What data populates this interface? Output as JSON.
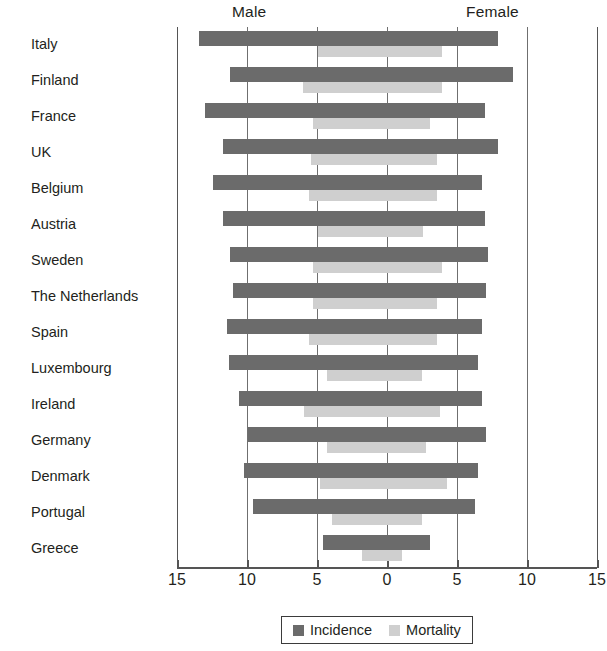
{
  "header": {
    "male_label": "Male",
    "female_label": "Female"
  },
  "legend": {
    "incidence_label": "Incidence",
    "mortality_label": "Mortality"
  },
  "colors": {
    "incidence": "#6b6b6b",
    "mortality": "#cfcfcf",
    "axis": "#555555",
    "grid": "#6f6f6f",
    "text": "#231f20"
  },
  "axis": {
    "tick_labels": [
      "15",
      "10",
      "5",
      "0",
      "5",
      "10",
      "15"
    ],
    "tick_values": [
      -15,
      -10,
      -5,
      0,
      5,
      10,
      15
    ],
    "min": -15,
    "max": 15
  },
  "chart_data": {
    "type": "bar",
    "title": "",
    "subtitle": "",
    "orientation": "horizontal",
    "style": "population-pyramid",
    "xlabel": "",
    "ylabel": "",
    "xlim": [
      -15,
      15
    ],
    "grid": true,
    "legend_position": "bottom",
    "sides": [
      "Male",
      "Female"
    ],
    "categories": [
      "Italy",
      "Finland",
      "France",
      "UK",
      "Belgium",
      "Austria",
      "Sweden",
      "The Netherlands",
      "Spain",
      "Luxembourg",
      "Ireland",
      "Germany",
      "Denmark",
      "Portugal",
      "Greece"
    ],
    "series": [
      {
        "name": "Incidence",
        "color": "#6b6b6b",
        "male": [
          13.4,
          11.2,
          13.0,
          11.7,
          12.4,
          11.7,
          11.2,
          11.0,
          11.4,
          11.3,
          10.6,
          9.9,
          10.2,
          9.6,
          4.6
        ],
        "female": [
          7.9,
          9.0,
          7.0,
          7.9,
          6.8,
          7.0,
          7.2,
          7.1,
          6.8,
          6.5,
          6.8,
          7.1,
          6.5,
          6.3,
          3.1
        ]
      },
      {
        "name": "Mortality",
        "color": "#cfcfcf",
        "male": [
          4.9,
          6.0,
          5.3,
          5.4,
          5.6,
          4.9,
          5.3,
          5.3,
          5.6,
          4.3,
          5.9,
          4.3,
          4.8,
          3.9,
          1.8
        ],
        "female": [
          3.9,
          3.9,
          3.1,
          3.6,
          3.6,
          2.6,
          3.9,
          3.6,
          3.6,
          2.5,
          3.8,
          2.8,
          4.3,
          2.5,
          1.1
        ]
      }
    ]
  }
}
